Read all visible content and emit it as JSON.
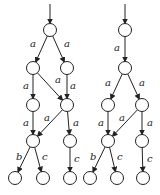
{
  "graphs": [
    {
      "name": "left-automaton",
      "nodes": [
        {
          "id": "L0",
          "x": 50,
          "y": 30
        },
        {
          "id": "L1",
          "x": 33,
          "y": 68
        },
        {
          "id": "L2",
          "x": 67,
          "y": 68
        },
        {
          "id": "L3",
          "x": 33,
          "y": 105
        },
        {
          "id": "L4",
          "x": 67,
          "y": 105
        },
        {
          "id": "L5",
          "x": 33,
          "y": 141
        },
        {
          "id": "L6",
          "x": 70,
          "y": 141
        },
        {
          "id": "L7",
          "x": 15,
          "y": 178
        },
        {
          "id": "L8",
          "x": 43,
          "y": 178
        },
        {
          "id": "L9",
          "x": 70,
          "y": 178
        }
      ],
      "start": {
        "x": 50,
        "y": 4,
        "to": "L0"
      },
      "edges": [
        {
          "from": "L0",
          "to": "L1",
          "label": "a",
          "lx": 30,
          "ly": 47
        },
        {
          "from": "L0",
          "to": "L2",
          "label": "a",
          "lx": 64,
          "ly": 47
        },
        {
          "from": "L1",
          "to": "L3",
          "label": "a",
          "lx": 23,
          "ly": 89
        },
        {
          "from": "L1",
          "to": "L4",
          "label": "a",
          "lx": 55,
          "ly": 83
        },
        {
          "from": "L2",
          "to": "L4",
          "label": "a",
          "lx": 70,
          "ly": 89
        },
        {
          "from": "L3",
          "to": "L5",
          "label": "a",
          "lx": 23,
          "ly": 126
        },
        {
          "from": "L4",
          "to": "L5",
          "label": "a",
          "lx": 44,
          "ly": 121
        },
        {
          "from": "L4",
          "to": "L6",
          "label": "a",
          "lx": 73,
          "ly": 126
        },
        {
          "from": "L5",
          "to": "L7",
          "label": "b",
          "lx": 16,
          "ly": 160
        },
        {
          "from": "L5",
          "to": "L8",
          "label": "c",
          "lx": 42,
          "ly": 160
        },
        {
          "from": "L6",
          "to": "L9",
          "label": "c",
          "lx": 74,
          "ly": 162
        }
      ]
    },
    {
      "name": "right-automaton",
      "nodes": [
        {
          "id": "R0",
          "x": 125,
          "y": 30
        },
        {
          "id": "R1",
          "x": 125,
          "y": 68
        },
        {
          "id": "R2",
          "x": 108,
          "y": 105
        },
        {
          "id": "R3",
          "x": 142,
          "y": 105
        },
        {
          "id": "R4",
          "x": 108,
          "y": 141
        },
        {
          "id": "R5",
          "x": 142,
          "y": 141
        },
        {
          "id": "R6",
          "x": 90,
          "y": 178
        },
        {
          "id": "R7",
          "x": 117,
          "y": 178
        },
        {
          "id": "R8",
          "x": 143,
          "y": 178
        }
      ],
      "start": {
        "x": 125,
        "y": 4,
        "to": "R0"
      },
      "edges": [
        {
          "from": "R0",
          "to": "R1",
          "label": "a",
          "lx": 114,
          "ly": 51
        },
        {
          "from": "R1",
          "to": "R2",
          "label": "a",
          "lx": 105,
          "ly": 86
        },
        {
          "from": "R1",
          "to": "R3",
          "label": "a",
          "lx": 139,
          "ly": 86
        },
        {
          "from": "R2",
          "to": "R4",
          "label": "a",
          "lx": 98,
          "ly": 126
        },
        {
          "from": "R3",
          "to": "R4",
          "label": "a",
          "lx": 119,
          "ly": 121
        },
        {
          "from": "R3",
          "to": "R5",
          "label": "a",
          "lx": 147,
          "ly": 126
        },
        {
          "from": "R4",
          "to": "R6",
          "label": "b",
          "lx": 90,
          "ly": 160
        },
        {
          "from": "R4",
          "to": "R7",
          "label": "c",
          "lx": 117,
          "ly": 160
        },
        {
          "from": "R5",
          "to": "R8",
          "label": "c",
          "lx": 147,
          "ly": 162
        }
      ]
    }
  ],
  "style": {
    "node_radius": 6.5,
    "stroke": "#222222"
  }
}
